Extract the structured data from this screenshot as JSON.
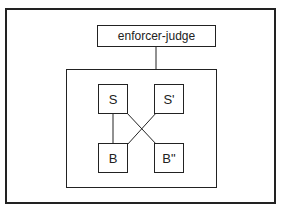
{
  "diagram": {
    "top_node": {
      "label": "enforcer-judge"
    },
    "nodes": [
      {
        "id": "S",
        "label": "S"
      },
      {
        "id": "S_prime",
        "label": "S'"
      },
      {
        "id": "B",
        "label": "B"
      },
      {
        "id": "B_double_prime",
        "label": "B\""
      }
    ],
    "edges": [
      {
        "from": "enforcer-judge",
        "to": "inner-group"
      },
      {
        "from": "S",
        "to": "B"
      },
      {
        "from": "S",
        "to": "B\""
      },
      {
        "from": "S'",
        "to": "B"
      }
    ],
    "colors": {
      "line": "#222222",
      "background": "#ffffff"
    }
  }
}
